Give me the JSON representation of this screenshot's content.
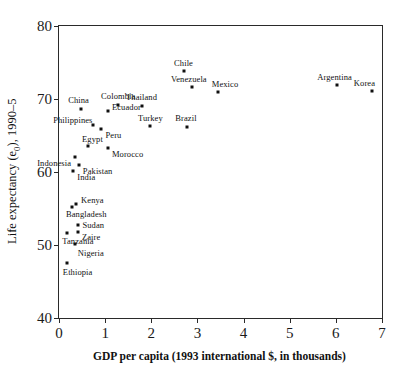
{
  "chart_data": {
    "type": "scatter",
    "title": "",
    "xlabel": "GDP per capita (1993 international $, in  thousands)",
    "ylabel": "Life expectancy (e₀), 1990–5",
    "ylabel_parts": {
      "pre": "Life expectancy (e",
      "sub": "0",
      "post": "), 1990–5"
    },
    "xlim": [
      0,
      7
    ],
    "ylim": [
      40,
      80
    ],
    "xticks": [
      "0",
      "1",
      "2",
      "3",
      "4",
      "5",
      "6",
      "7"
    ],
    "yticks": [
      "40",
      "50",
      "60",
      "70",
      "80"
    ],
    "xtick_values": [
      0,
      1,
      2,
      3,
      4,
      5,
      6,
      7
    ],
    "ytick_values": [
      40,
      50,
      60,
      70,
      80
    ],
    "grid": false,
    "legend": "none",
    "marker": "square-dot",
    "marker_color": "#101010",
    "points": [
      {
        "label": "China",
        "x": 0.48,
        "y": 68.6,
        "lx": -13,
        "ly": -14
      },
      {
        "label": "Colombia",
        "x": 1.28,
        "y": 69.2,
        "lx": -17,
        "ly": -14
      },
      {
        "label": "Thailand",
        "x": 1.8,
        "y": 69.1,
        "lx": -16,
        "ly": -14
      },
      {
        "label": "Ecuador",
        "x": 1.06,
        "y": 68.3,
        "lx": 4,
        "ly": -9
      },
      {
        "label": "Philippines",
        "x": 0.74,
        "y": 66.5,
        "lx": -40,
        "ly": -10
      },
      {
        "label": "Turkey",
        "x": 1.97,
        "y": 66.3,
        "lx": -12,
        "ly": -13
      },
      {
        "label": "Brazil",
        "x": 2.78,
        "y": 66.2,
        "lx": -12,
        "ly": -14
      },
      {
        "label": "Peru",
        "x": 0.92,
        "y": 65.9,
        "lx": 4,
        "ly": 1
      },
      {
        "label": "Egypt",
        "x": 0.63,
        "y": 63.6,
        "lx": -6,
        "ly": -12
      },
      {
        "label": "Morocco",
        "x": 1.06,
        "y": 63.3,
        "lx": 4,
        "ly": 1
      },
      {
        "label": "Indonesia",
        "x": 0.35,
        "y": 62.1,
        "lx": -38,
        "ly": 1
      },
      {
        "label": "Pakistan",
        "x": 0.43,
        "y": 61.0,
        "lx": 4,
        "ly": 1
      },
      {
        "label": "India",
        "x": 0.31,
        "y": 60.2,
        "lx": 4,
        "ly": 1
      },
      {
        "label": "Chile",
        "x": 2.71,
        "y": 73.8,
        "lx": -10,
        "ly": -13
      },
      {
        "label": "Venezuela",
        "x": 2.88,
        "y": 71.6,
        "lx": -21,
        "ly": -13
      },
      {
        "label": "Mexico",
        "x": 3.44,
        "y": 70.9,
        "lx": -6,
        "ly": -13
      },
      {
        "label": "Argentina",
        "x": 6.03,
        "y": 71.9,
        "lx": -20,
        "ly": -13
      },
      {
        "label": "Korea",
        "x": 6.78,
        "y": 71.1,
        "lx": -18,
        "ly": -13
      },
      {
        "label": "Kenya",
        "x": 0.37,
        "y": 55.6,
        "lx": 5,
        "ly": -9
      },
      {
        "label": "Bangladesh",
        "x": 0.28,
        "y": 55.2,
        "lx": -6,
        "ly": 2
      },
      {
        "label": "Sudan",
        "x": 0.42,
        "y": 52.8,
        "lx": 4,
        "ly": -5
      },
      {
        "label": "Zaire",
        "x": 0.41,
        "y": 51.8,
        "lx": 4,
        "ly": 0
      },
      {
        "label": "Tanzania",
        "x": 0.18,
        "y": 51.7,
        "lx": -5,
        "ly": 3
      },
      {
        "label": "Nigeria",
        "x": 0.34,
        "y": 50.2,
        "lx": 3,
        "ly": 4
      },
      {
        "label": "Ethiopia",
        "x": 0.17,
        "y": 47.6,
        "lx": -4,
        "ly": 4
      }
    ]
  }
}
